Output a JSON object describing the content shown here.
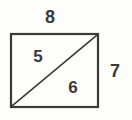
{
  "figure": {
    "background_color": "#fdfdfc",
    "stroke_color": "#3a3a3a",
    "label_color": "#3a3a3a",
    "rectangle": {
      "x": 11,
      "y": 34,
      "width": 87,
      "height": 73,
      "stroke_width": 2.2
    },
    "diagonal": {
      "x1": 11,
      "y1": 107,
      "x2": 98,
      "y2": 34,
      "stroke_width": 1.6,
      "description": "diagonal from bottom-left corner to top-right corner"
    },
    "labels": {
      "top": "8",
      "right": "7",
      "upper_left_region": "5",
      "lower_right_region": "6"
    }
  }
}
